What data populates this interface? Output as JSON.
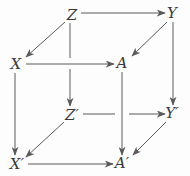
{
  "figure": {
    "kind": "commutative-cube-diagram",
    "width": 190,
    "height": 176,
    "background_color": "#fdfdfd",
    "stroke_color": "#5a5a5a",
    "label_color": "#3a3a3a"
  },
  "nodes": [
    {
      "id": "Z",
      "label": "Z",
      "x": 72,
      "y": 15
    },
    {
      "id": "Y",
      "label": "Y",
      "x": 172,
      "y": 13
    },
    {
      "id": "X",
      "label": "X",
      "x": 16,
      "y": 64
    },
    {
      "id": "A",
      "label": "A",
      "x": 122,
      "y": 63
    },
    {
      "id": "Zp",
      "label": "Z′",
      "x": 72,
      "y": 115
    },
    {
      "id": "Yp",
      "label": "Y′",
      "x": 172,
      "y": 113
    },
    {
      "id": "Xp",
      "label": "X′",
      "x": 17,
      "y": 164
    },
    {
      "id": "Ap",
      "label": "A′",
      "x": 122,
      "y": 163
    }
  ],
  "edges": [
    {
      "from": "Z",
      "to": "Y",
      "style": "solid",
      "direction": "right"
    },
    {
      "from": "Z",
      "to": "X",
      "style": "solid",
      "direction": "down-left"
    },
    {
      "from": "Z",
      "to": "Zp",
      "style": "solid",
      "direction": "down"
    },
    {
      "from": "Y",
      "to": "A",
      "style": "solid",
      "direction": "down-left"
    },
    {
      "from": "Y",
      "to": "Yp",
      "style": "solid",
      "direction": "down"
    },
    {
      "from": "X",
      "to": "A",
      "style": "solid",
      "direction": "right"
    },
    {
      "from": "X",
      "to": "Xp",
      "style": "solid",
      "direction": "down"
    },
    {
      "from": "A",
      "to": "Ap",
      "style": "solid",
      "direction": "down"
    },
    {
      "from": "Zp",
      "to": "Yp",
      "style": "solid",
      "direction": "right"
    },
    {
      "from": "Zp",
      "to": "Xp",
      "style": "solid",
      "direction": "down-left"
    },
    {
      "from": "Yp",
      "to": "Ap",
      "style": "solid",
      "direction": "down-left"
    },
    {
      "from": "Xp",
      "to": "Ap",
      "style": "solid",
      "direction": "right"
    }
  ]
}
